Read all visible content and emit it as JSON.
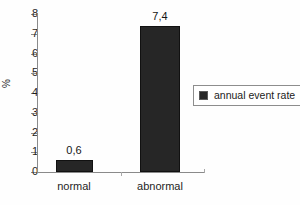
{
  "chart_data": {
    "type": "bar",
    "title": "",
    "subtitle": "",
    "xlabel": "",
    "ylabel": "%",
    "categories": [
      "normal",
      "abnormal"
    ],
    "values": [
      0.6,
      7.4
    ],
    "value_labels": [
      "0,6",
      "7,4"
    ],
    "ylim": [
      0,
      8
    ],
    "ytick_labels": [
      "0",
      "1",
      "2",
      "3",
      "4",
      "5",
      "6",
      "7",
      "8"
    ],
    "ytick_values": [
      0,
      1,
      2,
      3,
      4,
      5,
      6,
      7,
      8
    ],
    "grid": false,
    "legend": {
      "position": "right",
      "entries": [
        {
          "label": "annual event rate",
          "color": "#262626",
          "marker": "square"
        }
      ]
    },
    "series": [
      {
        "name": "annual event rate",
        "color": "#262626",
        "categories": [
          "normal",
          "abnormal"
        ],
        "values": [
          0.6,
          7.4
        ]
      }
    ],
    "colors": {
      "bar": "#262626",
      "bar_edge": "#111111",
      "axis": "#8a8a8a",
      "text": "#1f1f1f",
      "background": "#fefefe",
      "legend_border": "#8d8d8d"
    }
  }
}
